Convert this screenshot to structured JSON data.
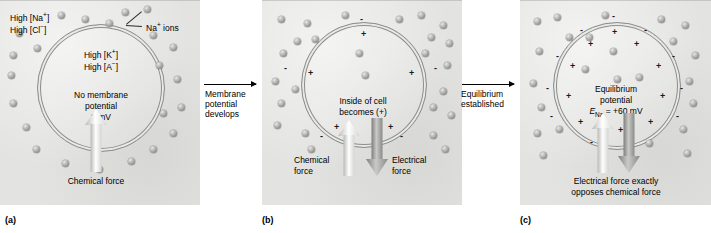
{
  "figure": {
    "type": "three-stage cell membrane potential diagram"
  },
  "panels": [
    {
      "id": "a",
      "label": "(a)",
      "outside_labels": [
        "High [Na+]",
        "High [Cl-]"
      ],
      "outside_label_1_main": "High [Na",
      "outside_label_2_main": "High [Cl",
      "callout": "Na+ ions",
      "callout_main": "Na",
      "callout_tail": " ions",
      "inside_labels": [
        "High [K+]",
        "High [A-]"
      ],
      "inside_label_1_main": "High [K",
      "inside_label_2_main": "High [A",
      "state_line1": "No membrane",
      "state_line2": "potential",
      "state_line3": "0 mV",
      "force_label": "Chemical force",
      "arrows": [
        {
          "name": "chemical-force-arrow",
          "direction": "up",
          "shade": "light"
        }
      ],
      "charges_outside": [],
      "charges_inside": []
    },
    {
      "id": "b",
      "label": "(b)",
      "state_line1": "Inside of cell",
      "state_line2": "becomes (+)",
      "force_label_left_line1": "Chemical",
      "force_label_left_line2": "force",
      "force_label_right_line1": "Electrical",
      "force_label_right_line2": "force",
      "arrows": [
        {
          "name": "chemical-force-arrow",
          "direction": "up",
          "shade": "light"
        },
        {
          "name": "electrical-force-arrow",
          "direction": "down",
          "shade": "dark"
        }
      ],
      "charges_outside": [
        "-",
        "-",
        "-",
        "-",
        "-"
      ],
      "charges_inside": [
        "+",
        "+",
        "+",
        "+",
        "+"
      ]
    },
    {
      "id": "c",
      "label": "(c)",
      "state_line1": "Equilibrium",
      "state_line2": "potential",
      "state_line3_symbol": "E",
      "state_line3_sub": "Na",
      "state_line3_value": " = +60 mV",
      "force_label_line1": "Electrical force exactly",
      "force_label_line2": "opposes chemical force",
      "arrows": [
        {
          "name": "chemical-force-arrow",
          "direction": "up",
          "shade": "light"
        },
        {
          "name": "electrical-force-arrow",
          "direction": "down",
          "shade": "dark"
        }
      ],
      "charges_outside": [
        "-",
        "-",
        "-",
        "-",
        "-",
        "-",
        "-",
        "-",
        "-",
        "-"
      ],
      "charges_inside": [
        "+",
        "+",
        "+",
        "+",
        "+",
        "+",
        "+",
        "+",
        "+",
        "+"
      ]
    }
  ],
  "transitions": [
    {
      "id": "a-to-b",
      "line1": "Membrane",
      "line2": "potential",
      "line3": "develops"
    },
    {
      "id": "b-to-c",
      "line1": "Equilibrium",
      "line2": "established",
      "line3": ""
    }
  ],
  "colors": {
    "panel_background": "#e3e3e1",
    "membrane_stroke": "#8d8d8d",
    "ion_fill": "#9a9a9a",
    "arrow_light": "#ffffff",
    "arrow_dark": "#8a8a88",
    "text": "#000000"
  },
  "superscripts": {
    "plus": "+",
    "minus": "−",
    "bracket_close": "]"
  }
}
